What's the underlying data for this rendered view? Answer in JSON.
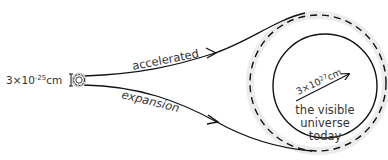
{
  "diagram": {
    "initial_size": {
      "base": "3×10",
      "exponent": "-25",
      "unit": "cm"
    },
    "path_label_top": "accelerated",
    "path_label_bottom": "expansion",
    "universe_radius": {
      "base": "3×10",
      "exponent": "27",
      "unit": "cm"
    },
    "universe_label": [
      "the visible",
      "universe",
      "today"
    ],
    "colors": {
      "line": "#111111",
      "text": "#333333",
      "halo": "#e6e6e6"
    }
  }
}
